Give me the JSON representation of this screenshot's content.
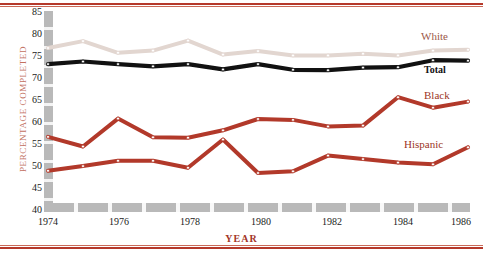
{
  "chart_data": {
    "type": "line",
    "title": "",
    "xlabel": "YEAR",
    "ylabel": "PERCENTAGE COMPLETED",
    "x": [
      1974,
      1975,
      1976,
      1977,
      1978,
      1979,
      1980,
      1981,
      1982,
      1983,
      1984,
      1985,
      1986
    ],
    "xlim": [
      1974,
      1986
    ],
    "ylim": [
      40,
      85
    ],
    "yticks": [
      40,
      45,
      50,
      55,
      60,
      65,
      70,
      75,
      80,
      85
    ],
    "xticks": [
      1974,
      1976,
      1978,
      1980,
      1982,
      1984,
      1986
    ],
    "grid": false,
    "legend_position": "right-inline",
    "series": [
      {
        "name": "White",
        "color": "#e2d6d0",
        "values": [
          76.5,
          78.1,
          75.4,
          75.9,
          78.2,
          75.0,
          75.8,
          74.8,
          74.8,
          75.2,
          74.8,
          75.9,
          76.1
        ]
      },
      {
        "name": "Total",
        "color": "#111111",
        "values": [
          72.8,
          73.4,
          72.8,
          72.3,
          72.8,
          71.6,
          72.8,
          71.5,
          71.4,
          72.0,
          72.1,
          73.7,
          73.6
        ]
      },
      {
        "name": "Black",
        "color": "#b2392a",
        "values": [
          56.1,
          53.9,
          60.3,
          56.0,
          55.9,
          57.6,
          60.2,
          60.0,
          58.5,
          58.7,
          65.2,
          62.8,
          64.2
        ]
      },
      {
        "name": "Hispanic",
        "color": "#b2392a",
        "values": [
          48.3,
          49.4,
          50.6,
          50.6,
          49.0,
          55.5,
          47.8,
          48.2,
          51.8,
          51.0,
          50.2,
          49.8,
          53.7
        ]
      }
    ]
  },
  "axis": {
    "y_label": "PERCENTAGE COMPLETED",
    "x_label": "YEAR",
    "y_ticks": [
      "85",
      "80",
      "75",
      "70",
      "65",
      "60",
      "55",
      "50",
      "45",
      "40"
    ],
    "x_ticks": [
      "1974",
      "1976",
      "1978",
      "1980",
      "1982",
      "1984",
      "1986"
    ]
  },
  "legend": {
    "white": "White",
    "total": "Total",
    "black": "Black",
    "hispanic": "Hispanic"
  }
}
